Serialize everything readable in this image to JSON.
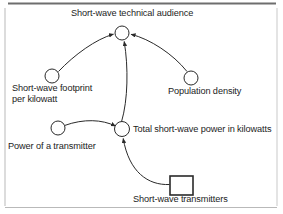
{
  "diagram": {
    "type": "causal-loop-stock-flow",
    "title_text": "Short-wave technical audience",
    "frame_color": "#8c8c8c",
    "line_color": "#2a2a2a",
    "text_color": "#1c1c1c",
    "background": "#ffffff",
    "nodes": [
      {
        "id": "audience",
        "label": "Short-wave technical audience",
        "shape": "circle",
        "x": 122,
        "y": 33,
        "r": 7,
        "label_position": "above"
      },
      {
        "id": "footprint",
        "label": "Short-wave footprint per kilowatt",
        "label_line1": "Short-wave footprint",
        "label_line2": "per kilowatt",
        "shape": "circle",
        "x": 52,
        "y": 76,
        "r": 7,
        "label_position": "below"
      },
      {
        "id": "population",
        "label": "Population density",
        "shape": "circle",
        "x": 191,
        "y": 78,
        "r": 7,
        "label_position": "below"
      },
      {
        "id": "power",
        "label": "Power of a transmitter",
        "shape": "circle",
        "x": 58,
        "y": 128,
        "r": 7,
        "label_position": "below"
      },
      {
        "id": "total",
        "label": "Total short-wave power in kilowatts",
        "shape": "circle",
        "x": 122,
        "y": 129,
        "r": 7,
        "label_position": "right"
      },
      {
        "id": "transmitters",
        "label": "Short-wave transmitters",
        "shape": "rectangle",
        "x": 170,
        "y": 176,
        "width": 23,
        "height": 19,
        "label_position": "below"
      }
    ],
    "edges": [
      {
        "from": "footprint",
        "to": "audience",
        "style": "curved-arrow"
      },
      {
        "from": "population",
        "to": "audience",
        "style": "curved-arrow"
      },
      {
        "from": "total",
        "to": "audience",
        "style": "curved-arrow"
      },
      {
        "from": "power",
        "to": "total",
        "style": "curved-arrow"
      },
      {
        "from": "transmitters",
        "to": "total",
        "style": "curved-arrow"
      }
    ]
  }
}
